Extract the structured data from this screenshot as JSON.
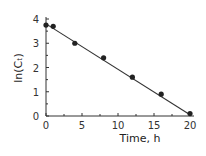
{
  "chart_data": {
    "type": "scatter",
    "title": "",
    "xlabel": "Time, h",
    "ylabel": "ln(Cₜ)",
    "xlim": [
      0,
      20
    ],
    "ylim": [
      0,
      4
    ],
    "xticks": [
      0,
      5,
      10,
      15,
      20
    ],
    "yticks": [
      0,
      1,
      2,
      3,
      4
    ],
    "grid": false,
    "legend": null,
    "series": [
      {
        "name": "data",
        "marker": "circle",
        "color": "#222222",
        "x": [
          0,
          1,
          4,
          8,
          12,
          16,
          20
        ],
        "y": [
          3.75,
          3.7,
          3.0,
          2.4,
          1.6,
          0.9,
          0.1
        ]
      },
      {
        "name": "linear fit",
        "style": "line",
        "color": "#333333",
        "x": [
          0,
          20
        ],
        "y": [
          3.8,
          0.05
        ]
      }
    ]
  },
  "axes": {
    "x_title": "Time, h",
    "y_title": "ln(Cₜ)",
    "x_tick_labels": [
      "0",
      "5",
      "10",
      "15",
      "20"
    ],
    "y_tick_labels": [
      "0",
      "1",
      "2",
      "3",
      "4"
    ]
  }
}
